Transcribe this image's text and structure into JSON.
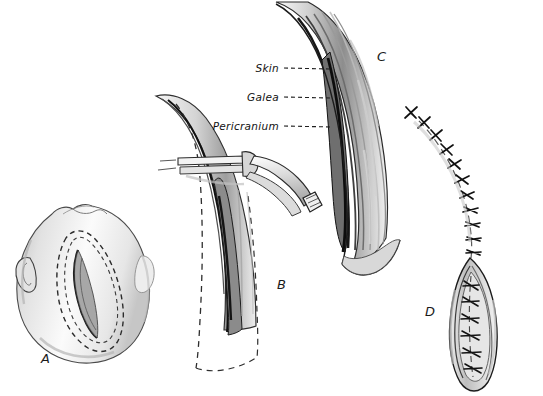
{
  "figure": {
    "background_color": "#ffffff",
    "ink_color": "#1a1a1a",
    "width": 543,
    "height": 396
  },
  "panels": [
    {
      "id": "A",
      "label": "A",
      "label_x": 47,
      "label_y": 359,
      "caption": "Head viewed from above with dashed elliptical scalp flap outline and midline incision"
    },
    {
      "id": "B",
      "label": "B",
      "label_x": 283,
      "label_y": 285,
      "caption": "Scalp incision held with hemostat clamp, dashed flap margins visible"
    },
    {
      "id": "C",
      "label": "C",
      "label_x": 383,
      "label_y": 57,
      "caption": "Cross-section of scalp layers retracted, labelled Skin, Galea, Pericranium"
    },
    {
      "id": "D",
      "label": "D",
      "label_x": 431,
      "label_y": 312,
      "caption": "Closed incision with interrupted sutures and residual open wound"
    }
  ],
  "layer_labels": [
    {
      "text": "Skin",
      "x": 279,
      "y": 72,
      "anchor": "end",
      "leader_from_x": 284,
      "leader_from_y": 68,
      "leader_to_x": 330,
      "leader_to_y": 69
    },
    {
      "text": "Galea",
      "x": 279,
      "y": 101,
      "anchor": "end",
      "leader_from_x": 284,
      "leader_from_y": 97,
      "leader_to_x": 330,
      "leader_to_y": 98
    },
    {
      "text": "Pericranium",
      "x": 279,
      "y": 130,
      "anchor": "end",
      "leader_from_x": 284,
      "leader_from_y": 126,
      "leader_to_x": 332,
      "leader_to_y": 127
    }
  ],
  "style": {
    "dash_pattern": "5,4",
    "suture_count_upper": 11,
    "suture_count_lower": 6,
    "shade_light": "#e9e9e9",
    "shade_mid": "#c9c9c9",
    "shade_dark": "#8f8f8f"
  }
}
